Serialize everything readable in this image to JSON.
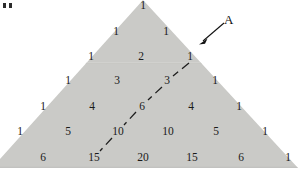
{
  "figure": {
    "background_color": "#ffffff",
    "triangle_fill": "#c9c9c6",
    "triangle_edge_color": "#b9b9b6",
    "text_color": "#1a1a1a"
  },
  "annotation": {
    "label": "A",
    "arrow_from": "225,22",
    "arrow_to": "200,44",
    "arrow_color": "#111111"
  },
  "corner_marks": {
    "glyph": "..",
    "count": 2
  },
  "diagonal": {
    "style": "dashed",
    "color": "#1d1d1d",
    "values": [
      1,
      3,
      6,
      10,
      15
    ],
    "description": "dashed diagonal through 1, 3, 6, 10, 15"
  },
  "chart_data": {
    "type": "table",
    "xlabel": "",
    "ylabel": "",
    "rows": [
      {
        "n": 0,
        "values": [
          1
        ]
      },
      {
        "n": 1,
        "values": [
          1,
          1
        ]
      },
      {
        "n": 2,
        "values": [
          1,
          2,
          1
        ]
      },
      {
        "n": 3,
        "values": [
          1,
          3,
          3,
          1
        ]
      },
      {
        "n": 4,
        "values": [
          1,
          4,
          6,
          4,
          1
        ]
      },
      {
        "n": 5,
        "values": [
          1,
          5,
          10,
          10,
          5,
          1
        ]
      },
      {
        "n": 6,
        "values": [
          1,
          6,
          15,
          20,
          15,
          6,
          1
        ]
      }
    ],
    "annotations": [
      "A"
    ],
    "highlighted_diagonal": [
      1,
      3,
      6,
      10,
      15
    ]
  },
  "cells": [
    {
      "text": "1",
      "x": 143,
      "y": 6,
      "clipped": false
    },
    {
      "text": "1",
      "x": 116,
      "y": 32,
      "clipped": false
    },
    {
      "text": "1",
      "x": 166,
      "y": 32,
      "clipped": false
    },
    {
      "text": "1",
      "x": 91,
      "y": 57,
      "clipped": false
    },
    {
      "text": "2",
      "x": 141,
      "y": 57,
      "clipped": false
    },
    {
      "text": "1",
      "x": 190,
      "y": 57,
      "clipped": false
    },
    {
      "text": "1",
      "x": 68,
      "y": 81,
      "clipped": false
    },
    {
      "text": "3",
      "x": 117,
      "y": 81,
      "clipped": false
    },
    {
      "text": "3",
      "x": 167,
      "y": 81,
      "clipped": false
    },
    {
      "text": "1",
      "x": 215,
      "y": 81,
      "clipped": false
    },
    {
      "text": "1",
      "x": 43,
      "y": 107,
      "clipped": false
    },
    {
      "text": "4",
      "x": 92,
      "y": 107,
      "clipped": false
    },
    {
      "text": "6",
      "x": 142,
      "y": 107,
      "clipped": false
    },
    {
      "text": "4",
      "x": 191,
      "y": 107,
      "clipped": false
    },
    {
      "text": "1",
      "x": 239,
      "y": 107,
      "clipped": false
    },
    {
      "text": "1",
      "x": 20,
      "y": 132,
      "clipped": false
    },
    {
      "text": "5",
      "x": 68,
      "y": 132,
      "clipped": false
    },
    {
      "text": "10",
      "x": 118,
      "y": 132,
      "clipped": false
    },
    {
      "text": "10",
      "x": 168,
      "y": 132,
      "clipped": false
    },
    {
      "text": "5",
      "x": 216,
      "y": 132,
      "clipped": false
    },
    {
      "text": "1",
      "x": 265,
      "y": 132,
      "clipped": false
    },
    {
      "text": "1",
      "x": -4,
      "y": 158,
      "clipped": true
    },
    {
      "text": "6",
      "x": 43,
      "y": 158,
      "clipped": false
    },
    {
      "text": "15",
      "x": 94,
      "y": 158,
      "clipped": false
    },
    {
      "text": "20",
      "x": 143,
      "y": 158,
      "clipped": false
    },
    {
      "text": "15",
      "x": 192,
      "y": 158,
      "clipped": false
    },
    {
      "text": "6",
      "x": 241,
      "y": 158,
      "clipped": false
    },
    {
      "text": "1",
      "x": 288,
      "y": 158,
      "clipped": false
    }
  ]
}
